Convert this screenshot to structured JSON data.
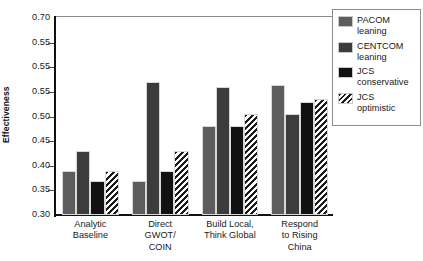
{
  "chart_data": {
    "type": "bar",
    "title": "",
    "xlabel": "",
    "ylabel": "Effectiveness",
    "ylim": [
      0.3,
      0.7
    ],
    "ytick_step": 0.05,
    "grid": false,
    "legend_position": "right",
    "bar_orientation": "vertical",
    "grouped": true,
    "ytick_labels": [
      "0.70",
      "0.55",
      "0.55",
      "0.55",
      "0.50",
      "0.45",
      "0.40",
      "0.35",
      "0.30"
    ],
    "ytick_values": [
      0.7,
      0.65,
      0.6,
      0.55,
      0.5,
      0.45,
      0.4,
      0.35,
      0.3
    ],
    "categories": [
      "Analytic\nBaseline",
      "Direct\nGWOT/\nCOIN",
      "Build Local,\nThink Global",
      "Respond\nto Rising\nChina"
    ],
    "series": [
      {
        "name": "PACOM\nleaning",
        "fill": "#5d5d5d",
        "pattern": "solid",
        "values": [
          0.39,
          0.37,
          0.48,
          0.565
        ]
      },
      {
        "name": "CENTCOM\nleaning",
        "fill": "#3c3c3c",
        "pattern": "solid",
        "values": [
          0.43,
          0.57,
          0.56,
          0.505
        ]
      },
      {
        "name": "JCS\nconservative",
        "fill": "#111111",
        "pattern": "solid",
        "values": [
          0.37,
          0.39,
          0.48,
          0.53
        ]
      },
      {
        "name": "JCS\noptimistic",
        "fill": "#ffffff",
        "pattern": "diagonal-hatch",
        "values": [
          0.39,
          0.43,
          0.505,
          0.535
        ]
      }
    ]
  },
  "colors": {
    "axis": "#111111",
    "frame": "#8d8d8d",
    "text": "#1a1a1a",
    "background": "#ffffff"
  }
}
